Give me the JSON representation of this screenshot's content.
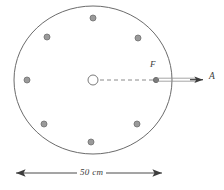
{
  "figure": {
    "labels": {
      "focus_point": "F",
      "axis_point": "A",
      "dimension": "50 cm"
    },
    "colors": {
      "outline": "#6b6b6b",
      "dot_fill": "#9a9a9a",
      "dot_stroke": "#6f6f6f",
      "dash": "#8a8a8a",
      "dimension_line": "#4a4a4a",
      "text": "#3b3b3b",
      "background": "#ffffff"
    },
    "disc": {
      "center_x": 93,
      "center_y": 80,
      "radius_x": 79,
      "radius_y": 74,
      "hub_radius": 5
    },
    "dots": [
      {
        "id": "dot-top",
        "x": 93,
        "y": 18,
        "r": 3.0
      },
      {
        "id": "dot-upper-left",
        "x": 47,
        "y": 37,
        "r": 3.0
      },
      {
        "id": "dot-upper-right",
        "x": 138,
        "y": 38,
        "r": 3.0
      },
      {
        "id": "dot-left",
        "x": 27,
        "y": 80,
        "r": 3.0
      },
      {
        "id": "dot-lower-left",
        "x": 44,
        "y": 124,
        "r": 3.0
      },
      {
        "id": "dot-lower-right",
        "x": 137,
        "y": 124,
        "r": 3.0
      },
      {
        "id": "dot-bottom",
        "x": 91,
        "y": 142,
        "r": 3.0
      },
      {
        "id": "dot-focus",
        "x": 156,
        "y": 80,
        "r": 2.6
      }
    ],
    "dashed_radius": {
      "x1": 100,
      "y1": 80,
      "x2": 154,
      "y2": 80
    },
    "shaft": {
      "x1": 157,
      "y1": 78.2,
      "x2": 196,
      "y2": 78.2,
      "x3": 157,
      "y3": 81.2,
      "x4": 196,
      "y4": 81.2
    },
    "arrow_right": {
      "tip_x": 207,
      "y": 79.7
    },
    "dimension_line": {
      "x1": 9,
      "x2": 169,
      "y": 173
    }
  }
}
